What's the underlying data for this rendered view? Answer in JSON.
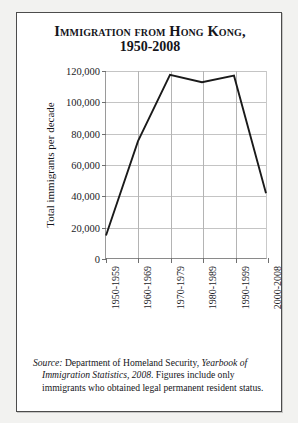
{
  "figure": {
    "title_line1": "Immigration from Hong Kong,",
    "title_line2": "1950-2008"
  },
  "source_note": {
    "lead": "Source:",
    "text_1": " Department of Homeland Security, ",
    "publication": "Yearbook of Immigration Statistics, 2008",
    "text_2": ". Figures include only immigrants who obtained legal permanent resident status."
  },
  "chart_data": {
    "type": "line",
    "title": "Immigration from Hong Kong, 1950-2008",
    "xlabel": "",
    "ylabel": "Total immigrants per decade",
    "categories": [
      "1950-1959",
      "1960-1969",
      "1970-1979",
      "1980-1989",
      "1990-1999",
      "2000-2008"
    ],
    "values": [
      14400,
      75000,
      117600,
      112800,
      117000,
      41500
    ],
    "ylim": [
      0,
      120000
    ],
    "ytick_values": [
      0,
      20000,
      40000,
      60000,
      80000,
      100000,
      120000
    ],
    "ytick_labels": [
      "0",
      "20,000",
      "40,000",
      "60,000",
      "80,000",
      "100,000",
      "120,000"
    ],
    "grid": true,
    "legend": false,
    "line_color": "#1a1a1a",
    "grid_color": "#c4c4c4"
  }
}
